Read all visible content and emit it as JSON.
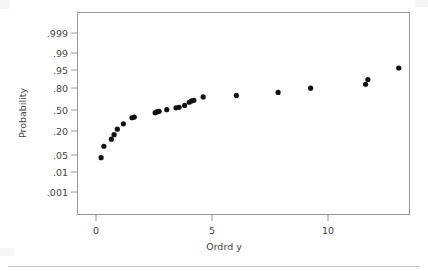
{
  "figure": {
    "background_color": "#ffffff",
    "frame_color": "#9a9a9a",
    "point_color": "#111111",
    "text_color": "#444444"
  },
  "chart_data": {
    "type": "scatter",
    "title": "",
    "subtitle": "",
    "xlabel": "Ordrd y",
    "ylabel": "Probability",
    "grid": false,
    "legend": null,
    "yscale": "normal-probability",
    "xlim": [
      -0.82,
      13.55
    ],
    "ylim_labels": [
      ".001",
      ".999"
    ],
    "xticks": [
      0,
      5,
      10
    ],
    "xticklabels": [
      "0",
      "5",
      "10"
    ],
    "yticks": [
      0.001,
      0.01,
      0.05,
      0.2,
      0.5,
      0.8,
      0.95,
      0.99,
      0.999
    ],
    "yticklabels": [
      ".001",
      ".01",
      ".05",
      ".20",
      ".50",
      ".80",
      ".95",
      ".99",
      ".999"
    ],
    "marker": "circle",
    "marker_size": 2.6,
    "n_points": 25,
    "x": [
      0.22,
      0.34,
      0.66,
      0.78,
      0.92,
      1.18,
      1.55,
      1.65,
      2.55,
      2.62,
      2.72,
      3.05,
      3.45,
      3.58,
      3.82,
      4.02,
      4.12,
      4.22,
      4.62,
      6.05,
      7.85,
      9.25,
      11.62,
      11.72,
      13.05
    ],
    "y": [
      0.025,
      0.068,
      0.115,
      0.155,
      0.215,
      0.285,
      0.375,
      0.385,
      0.455,
      0.468,
      0.478,
      0.505,
      0.535,
      0.545,
      0.575,
      0.625,
      0.645,
      0.655,
      0.705,
      0.725,
      0.765,
      0.815,
      0.855,
      0.895,
      0.958
    ],
    "points": [
      {
        "x": 0.22,
        "p": 0.025
      },
      {
        "x": 0.34,
        "p": 0.068
      },
      {
        "x": 0.66,
        "p": 0.115
      },
      {
        "x": 0.78,
        "p": 0.155
      },
      {
        "x": 0.92,
        "p": 0.215
      },
      {
        "x": 1.18,
        "p": 0.285
      },
      {
        "x": 1.55,
        "p": 0.375
      },
      {
        "x": 1.65,
        "p": 0.385
      },
      {
        "x": 2.55,
        "p": 0.455
      },
      {
        "x": 2.62,
        "p": 0.468
      },
      {
        "x": 2.72,
        "p": 0.478
      },
      {
        "x": 3.05,
        "p": 0.505
      },
      {
        "x": 3.45,
        "p": 0.535
      },
      {
        "x": 3.58,
        "p": 0.545
      },
      {
        "x": 3.82,
        "p": 0.575
      },
      {
        "x": 4.02,
        "p": 0.625
      },
      {
        "x": 4.12,
        "p": 0.645
      },
      {
        "x": 4.22,
        "p": 0.655
      },
      {
        "x": 4.62,
        "p": 0.705
      },
      {
        "x": 6.05,
        "p": 0.725
      },
      {
        "x": 7.85,
        "p": 0.765
      },
      {
        "x": 9.25,
        "p": 0.815
      },
      {
        "x": 11.62,
        "p": 0.855
      },
      {
        "x": 11.72,
        "p": 0.895
      },
      {
        "x": 13.05,
        "p": 0.958
      }
    ]
  }
}
